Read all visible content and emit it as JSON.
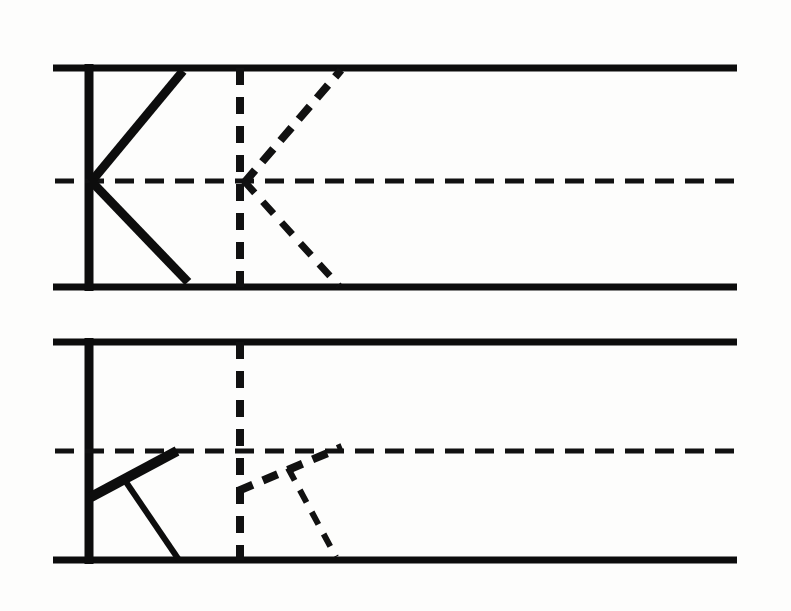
{
  "figure": {
    "title": "",
    "background_color": "#fdfdfc",
    "ink_color": "#0d0d0d",
    "width": 791,
    "height": 611
  },
  "chart_data": {
    "type": "diagram",
    "title": "",
    "xlabel": "",
    "ylabel": "",
    "panels": [
      {
        "id": "panel-upper",
        "label": "",
        "upper_wall_y": 68,
        "lower_wall_y": 287,
        "centerline_y": 181,
        "wall_x_start": 53,
        "wall_x_end": 737,
        "vertical_wall_x": 89,
        "vertical_station_x": 240,
        "solid_figure": {
          "vertex": [
            93,
            181
          ],
          "upper_arm_end": [
            183,
            71
          ],
          "lower_arm_end": [
            188,
            282
          ],
          "upper_arm_width": 9,
          "lower_arm_width": 9,
          "style": "solid"
        },
        "dashed_figure": {
          "vertex": [
            246,
            181
          ],
          "upper_arm_end": [
            341,
            70
          ],
          "lower_arm_end": [
            339,
            286
          ],
          "upper_arm_width": 8,
          "lower_arm_width": 7,
          "style": "dashed"
        }
      },
      {
        "id": "panel-lower",
        "label": "",
        "upper_wall_y": 342,
        "lower_wall_y": 560,
        "centerline_y": 451,
        "wall_x_start": 53,
        "wall_x_end": 737,
        "vertical_wall_x": 89,
        "vertical_station_x": 240,
        "solid_figure": {
          "vertex": [
            93,
            497
          ],
          "upper_arm_end": [
            177,
            451
          ],
          "branch_point": [
            126,
            482
          ],
          "lower_arm_end": [
            179,
            560
          ],
          "upper_arm_width": 10,
          "lower_arm_width": 6,
          "style": "solid"
        },
        "dashed_figure": {
          "vertex": [
            240,
            491
          ],
          "upper_arm_end": [
            342,
            447
          ],
          "branch_point": [
            288,
            468
          ],
          "lower_arm_end": [
            336,
            557
          ],
          "upper_arm_width": 8,
          "lower_arm_width": 6,
          "style": "dashed"
        }
      }
    ],
    "legend": [],
    "annotations": []
  },
  "elements": {
    "upper_panel_name": "upper-panel",
    "lower_panel_name": "lower-panel"
  }
}
